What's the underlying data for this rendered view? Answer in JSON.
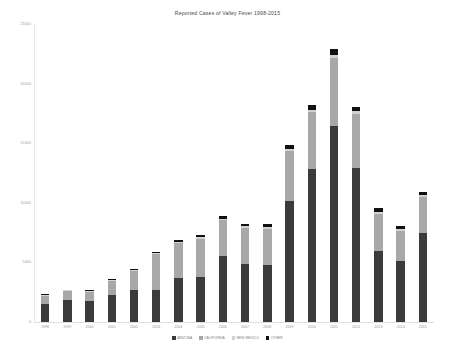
{
  "chart": {
    "title": "Reported Cases of Valley Fever 1998-2015"
  },
  "legend": {
    "items": [
      {
        "label": "ARIZONA",
        "color": "#3b3b3b"
      },
      {
        "label": "CALIFORNIA",
        "color": "#a8a8a8"
      },
      {
        "label": "NEW MEXICO",
        "color": "#d2d2d2"
      },
      {
        "label": "OTHER",
        "color": "#111111"
      }
    ]
  },
  "yaxis": {
    "ticks": [
      "0",
      "5000",
      "10000",
      "15000",
      "20000",
      "25000"
    ]
  },
  "chart_data": {
    "type": "bar",
    "title": "Reported Cases of Valley Fever 1998-2015",
    "xlabel": "",
    "ylabel": "",
    "ylim": [
      0,
      25000
    ],
    "yticks": [
      0,
      5000,
      10000,
      15000,
      20000,
      25000
    ],
    "grid": false,
    "stacked": true,
    "legend_position": "bottom",
    "categories": [
      "1998",
      "1999",
      "2000",
      "2001",
      "2002",
      "2003",
      "2004",
      "2005",
      "2006",
      "2007",
      "2008",
      "2009",
      "2010",
      "2011",
      "2012",
      "2013",
      "2014",
      "2015"
    ],
    "series": [
      {
        "name": "ARIZONA",
        "color": "#3b3b3b",
        "values": [
          1474,
          1812,
          1736,
          2303,
          2691,
          2695,
          3664,
          3818,
          5535,
          4830,
          4768,
          10189,
          12815,
          16467,
          12920,
          5938,
          5107,
          7466
        ]
      },
      {
        "name": "CALIFORNIA",
        "color": "#a8a8a8",
        "values": [
          719,
          777,
          793,
          1168,
          1558,
          2981,
          2962,
          3188,
          3002,
          3042,
          3051,
          4126,
          4769,
          5697,
          4539,
          3136,
          2554,
          3023
        ]
      },
      {
        "name": "NEW MEXICO",
        "color": "#d2d2d2",
        "values": [
          56,
          62,
          70,
          80,
          90,
          101,
          116,
          129,
          141,
          152,
          163,
          190,
          215,
          247,
          218,
          168,
          140,
          158
        ]
      },
      {
        "name": "OTHER",
        "color": "#111111",
        "values": [
          64,
          71,
          78,
          92,
          110,
          131,
          152,
          174,
          205,
          231,
          250,
          318,
          392,
          466,
          405,
          300,
          248,
          289
        ]
      }
    ]
  }
}
